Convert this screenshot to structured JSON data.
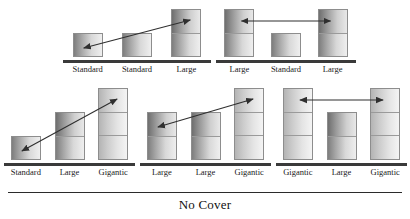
{
  "figure": {
    "caption": "No Cover",
    "bar_types": {
      "Standard": 1,
      "Large": 2,
      "Gigantic": 3
    },
    "arrow_color": "#2f2f2f",
    "axis_color": "#3a3a3a",
    "panels": [
      {
        "id": "panel-top-left",
        "row": "top",
        "position": 1,
        "bars": [
          {
            "label": "Standard",
            "segments": 1
          },
          {
            "label": "Standard",
            "segments": 1
          },
          {
            "label": "Large",
            "segments": 2
          }
        ],
        "arrow": {
          "type": "double-headed",
          "direction": "diagonal-up-right",
          "from_bar": 1,
          "to_bar": 3
        }
      },
      {
        "id": "panel-top-right",
        "row": "top",
        "position": 2,
        "bars": [
          {
            "label": "Large",
            "segments": 2
          },
          {
            "label": "Standard",
            "segments": 1
          },
          {
            "label": "Large",
            "segments": 2
          }
        ],
        "arrow": {
          "type": "double-headed",
          "direction": "horizontal",
          "from_bar": 1,
          "to_bar": 3
        }
      },
      {
        "id": "panel-bottom-left",
        "row": "bottom",
        "position": 1,
        "bars": [
          {
            "label": "Standard",
            "segments": 1
          },
          {
            "label": "Large",
            "segments": 2
          },
          {
            "label": "Gigantic",
            "segments": 3
          }
        ],
        "arrow": {
          "type": "double-headed",
          "direction": "diagonal-up-right",
          "from_bar": 1,
          "to_bar": 3
        }
      },
      {
        "id": "panel-bottom-middle",
        "row": "bottom",
        "position": 2,
        "bars": [
          {
            "label": "Large",
            "segments": 2
          },
          {
            "label": "Large",
            "segments": 2
          },
          {
            "label": "Gigantic",
            "segments": 3
          }
        ],
        "arrow": {
          "type": "double-headed",
          "direction": "diagonal-up-right",
          "from_bar": 1,
          "to_bar": 3
        }
      },
      {
        "id": "panel-bottom-right",
        "row": "bottom",
        "position": 3,
        "bars": [
          {
            "label": "Gigantic",
            "segments": 3
          },
          {
            "label": "Large",
            "segments": 2
          },
          {
            "label": "Gigantic",
            "segments": 3
          }
        ],
        "arrow": {
          "type": "double-headed",
          "direction": "horizontal",
          "from_bar": 1,
          "to_bar": 3
        }
      }
    ]
  },
  "chart_data": {
    "type": "bar",
    "title": "No Cover",
    "xlabel": "",
    "ylabel": "",
    "grid": false,
    "legend": "none",
    "unit": "segments",
    "categories_key": "bar size label",
    "panels": [
      {
        "name": "panel-top-left",
        "categories": [
          "Standard",
          "Standard",
          "Large"
        ],
        "values": [
          1,
          1,
          2
        ],
        "annotation": "double-headed diagonal arrow from bar 1 to bar 3"
      },
      {
        "name": "panel-top-right",
        "categories": [
          "Large",
          "Standard",
          "Large"
        ],
        "values": [
          2,
          1,
          2
        ],
        "annotation": "double-headed horizontal arrow from bar 1 to bar 3"
      },
      {
        "name": "panel-bottom-left",
        "categories": [
          "Standard",
          "Large",
          "Gigantic"
        ],
        "values": [
          1,
          2,
          3
        ],
        "annotation": "double-headed diagonal arrow from bar 1 to bar 3"
      },
      {
        "name": "panel-bottom-middle",
        "categories": [
          "Large",
          "Large",
          "Gigantic"
        ],
        "values": [
          2,
          2,
          3
        ],
        "annotation": "double-headed diagonal arrow from bar 1 to bar 3"
      },
      {
        "name": "panel-bottom-right",
        "categories": [
          "Gigantic",
          "Large",
          "Gigantic"
        ],
        "values": [
          3,
          2,
          3
        ],
        "annotation": "double-headed horizontal arrow from bar 1 to bar 3"
      }
    ]
  }
}
